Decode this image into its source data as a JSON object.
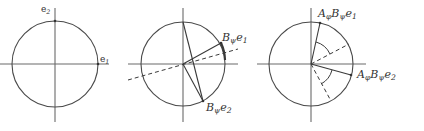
{
  "figure": {
    "panels": [
      {
        "id": "basis",
        "labels": {
          "e2": {
            "base": "e",
            "sub": "2"
          },
          "e1": {
            "base": "e",
            "sub": "1"
          }
        }
      },
      {
        "id": "B-transform",
        "labels": {
          "Be1": {
            "base": "B",
            "sub": "ψ",
            "tail": "e",
            "tail_sub": "1"
          },
          "Be2": {
            "base": "B",
            "sub": "ψ",
            "tail": "e",
            "tail_sub": "2"
          }
        }
      },
      {
        "id": "AB-transform",
        "labels": {
          "ABe1": {
            "a": "A",
            "a_sub": "φ",
            "b": "B",
            "b_sub": "ψ",
            "tail": "e",
            "tail_sub": "1"
          },
          "ABe2": {
            "a": "A",
            "a_sub": "φ",
            "b": "B",
            "b_sub": "ψ",
            "tail": "e",
            "tail_sub": "2"
          }
        }
      }
    ]
  }
}
